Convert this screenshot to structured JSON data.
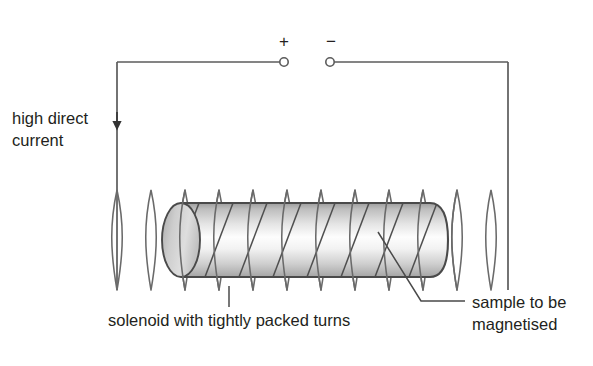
{
  "figure": {
    "background_color": "#ffffff",
    "line_color": "#5b5b5b",
    "text_color": "#231f20"
  },
  "terminals": {
    "positive_label": "+",
    "negative_label": "−",
    "marker_shape": "open-circle"
  },
  "labels": {
    "supply_line1": "high direct",
    "supply_line2": "current",
    "solenoid": "solenoid with tightly packed turns",
    "sample_line1": "sample to be",
    "sample_line2": "magnetised"
  },
  "circuit": {
    "arrow_direction": "down",
    "top_wire_y": 62,
    "left_wire_x": 117,
    "right_wire_x": 508
  },
  "solenoid": {
    "turn_count": 12,
    "first_turn_x": 117,
    "turn_spacing": 34,
    "top_y": 183,
    "bottom_y": 291
  },
  "sample": {
    "shape": "cylinder",
    "left_x": 181,
    "right_x": 448,
    "top_y": 203,
    "bottom_y": 277,
    "fill_light": "#ffffff",
    "fill_shade": "#b8b8b8",
    "outline": "#4a4a4a"
  }
}
